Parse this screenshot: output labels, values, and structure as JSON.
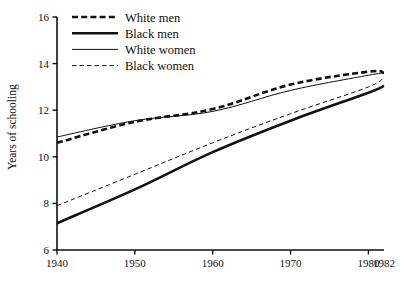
{
  "chart_data": {
    "type": "line",
    "title": "",
    "xlabel": "",
    "ylabel": "Years of schooling",
    "xlim": [
      1940,
      1982
    ],
    "ylim": [
      6,
      16
    ],
    "grid": false,
    "legend_position": "top-left",
    "x_ticks": [
      "1940",
      "1950",
      "1960",
      "1970",
      "1980",
      "1982"
    ],
    "x_tick_values": [
      1940,
      1950,
      1960,
      1970,
      1980,
      1982
    ],
    "y_ticks": [
      "6",
      "8",
      "10",
      "12",
      "14",
      "16"
    ],
    "y_tick_values": [
      6,
      8,
      10,
      12,
      14,
      16
    ],
    "x": [
      1940,
      1950,
      1960,
      1970,
      1980,
      1982
    ],
    "series": [
      {
        "name": "White men",
        "style": "dashed",
        "width": 2.6,
        "color": "#111111",
        "values": [
          10.6,
          11.5,
          12.05,
          13.1,
          13.65,
          13.6
        ]
      },
      {
        "name": "Black men",
        "style": "solid",
        "width": 2.6,
        "color": "#111111",
        "values": [
          7.15,
          8.6,
          10.2,
          11.55,
          12.75,
          13.05
        ]
      },
      {
        "name": "White women",
        "style": "solid",
        "width": 1.0,
        "color": "#111111",
        "values": [
          10.85,
          11.55,
          11.95,
          12.85,
          13.5,
          13.6
        ]
      },
      {
        "name": "Black women",
        "style": "dashed",
        "width": 1.0,
        "color": "#111111",
        "values": [
          7.9,
          9.25,
          10.6,
          11.85,
          13.0,
          13.45
        ]
      }
    ]
  },
  "legend": {
    "items": [
      {
        "label": "White men"
      },
      {
        "label": "Black men"
      },
      {
        "label": "White women"
      },
      {
        "label": "Black women"
      }
    ]
  },
  "axes": {
    "y_title": "Years of schooling"
  },
  "colors": {
    "ink": "#111111",
    "background": "#ffffff"
  }
}
